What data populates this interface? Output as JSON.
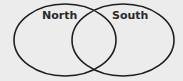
{
  "diagram": {
    "type": "venn",
    "background": "#ececec",
    "stroke_color": "#1e1e1e",
    "sets": [
      {
        "id": "north",
        "label": "North",
        "cx": 65,
        "cy": 40,
        "rx": 51,
        "ry": 36
      },
      {
        "id": "south",
        "label": "South",
        "cx": 123,
        "cy": 40,
        "rx": 51,
        "ry": 36
      }
    ]
  }
}
